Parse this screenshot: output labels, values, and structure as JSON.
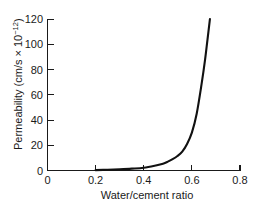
{
  "chart_data": {
    "type": "line",
    "title": "",
    "xlabel": "Water/cement ratio",
    "ylabel": "Permeability (cm/s × 10⁻¹²)",
    "ylabel_base": "Permeability (cm/s × 10",
    "ylabel_exponent": "−12",
    "ylabel_close": ")",
    "xlim": [
      0,
      0.8
    ],
    "ylim": [
      0,
      120
    ],
    "xticks": [
      0,
      0.2,
      0.4,
      0.6,
      0.8
    ],
    "xtick_labels": [
      "0",
      "0.2",
      "0.4",
      "0.6",
      "0.8"
    ],
    "yticks": [
      0,
      20,
      40,
      60,
      80,
      100,
      120
    ],
    "ytick_labels": [
      "0",
      "20",
      "40",
      "60",
      "80",
      "100",
      "120"
    ],
    "grid": false,
    "legend": false,
    "legend_position": "none",
    "line_color": "#111111",
    "series": [
      {
        "name": "permeability",
        "x": [
          0.2,
          0.25,
          0.3,
          0.35,
          0.4,
          0.45,
          0.48,
          0.5,
          0.52,
          0.54,
          0.56,
          0.58,
          0.6,
          0.62,
          0.64,
          0.655,
          0.665,
          0.675
        ],
        "values": [
          0.3,
          0.6,
          1.0,
          1.5,
          2.2,
          4.0,
          5.4,
          7.0,
          9.0,
          11.5,
          15.0,
          21.0,
          30.0,
          45.0,
          68.0,
          88.0,
          104.0,
          120.0
        ]
      }
    ]
  }
}
